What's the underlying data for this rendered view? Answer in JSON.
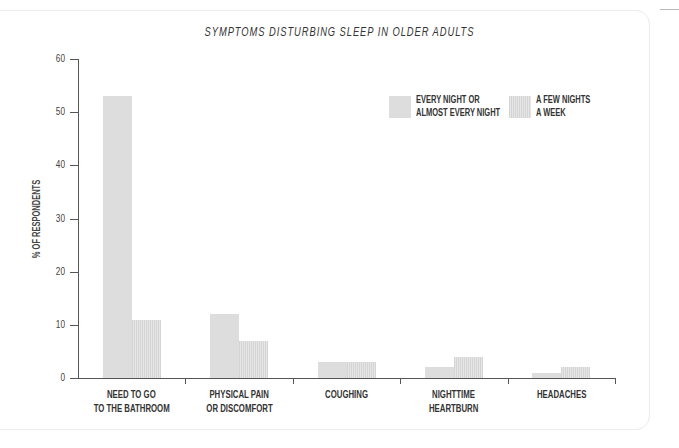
{
  "chart_data": {
    "type": "bar",
    "title": "SYMPTOMS DISTURBING SLEEP IN OLDER ADULTS",
    "xlabel": "",
    "ylabel": "% OF RESPONDENTS",
    "ylim": [
      0,
      60
    ],
    "yticks": [
      "0",
      "10",
      "20",
      "30",
      "40",
      "50",
      "60"
    ],
    "grid": false,
    "legend_position": "top-right",
    "categories": [
      [
        "NEED TO GO",
        "TO THE BATHROOM"
      ],
      [
        "PHYSICAL PAIN",
        "OR DISCOMFORT"
      ],
      [
        "COUGHING"
      ],
      [
        "NIGHTTIME",
        "HEARTBURN"
      ],
      [
        "HEADACHES"
      ]
    ],
    "series": [
      {
        "name": "EVERY NIGHT OR ALMOST EVERY NIGHT",
        "legend_lines": [
          "EVERY NIGHT OR",
          "ALMOST EVERY NIGHT"
        ],
        "color": "#dddddd",
        "values": [
          53,
          12,
          3,
          2,
          1
        ]
      },
      {
        "name": "A FEW NIGHTS A WEEK",
        "legend_lines": [
          "A FEW NIGHTS",
          "A WEEK"
        ],
        "color": "#d4d4d4",
        "pattern": "vertical-stripes",
        "values": [
          11,
          7,
          3,
          4,
          2
        ]
      }
    ]
  }
}
